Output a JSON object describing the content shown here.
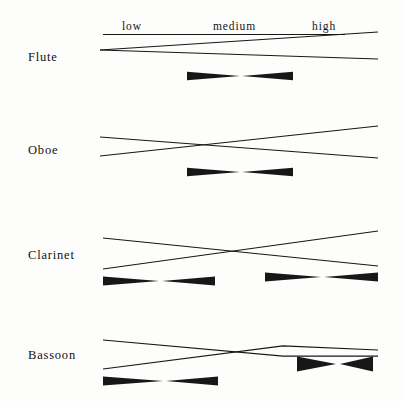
{
  "figure": {
    "background_color": "#fdfdfc",
    "ink_color": "#171717",
    "width": 403,
    "height": 401
  },
  "register_headers": [
    {
      "label": "low",
      "x": 122,
      "y": 30
    },
    {
      "label": "medium",
      "x": 213,
      "y": 30
    },
    {
      "label": "high",
      "x": 312,
      "y": 30
    }
  ],
  "header_rule": {
    "x1": 103,
    "y1": 34,
    "x2": 345,
    "y2": 34
  },
  "instruments": [
    {
      "name": "Flute",
      "label_x": 28,
      "label_y": 61,
      "baseline": 50,
      "lines": [
        {
          "name": "upper-envelope",
          "points": "100,50 378,32"
        },
        {
          "name": "lower-envelope",
          "points": "100,50 378,59"
        }
      ],
      "markers": [
        {
          "name": "bowtie-medium",
          "x_left": 187,
          "x_right": 293,
          "x_center": 240,
          "y": 76,
          "half_height": 4.2
        }
      ]
    },
    {
      "name": "Oboe",
      "label_x": 28,
      "label_y": 154,
      "baseline": 147,
      "lines": [
        {
          "name": "upper-envelope",
          "points": "100,137 378,158"
        },
        {
          "name": "lower-envelope",
          "points": "100,156 378,126"
        }
      ],
      "markers": [
        {
          "name": "bowtie-medium",
          "x_left": 187,
          "x_right": 293,
          "x_center": 240,
          "y": 172,
          "half_height": 4.2
        }
      ]
    },
    {
      "name": "Clarinet",
      "label_x": 28,
      "label_y": 259,
      "baseline": 252,
      "lines": [
        {
          "name": "upper-envelope",
          "points": "103,238 378,266"
        },
        {
          "name": "lower-envelope",
          "points": "103,269 378,231"
        }
      ],
      "markers": [
        {
          "name": "bowtie-low",
          "x_left": 103,
          "x_right": 215,
          "x_center": 159,
          "y": 281,
          "half_height": 4.6
        },
        {
          "name": "bowtie-high",
          "x_left": 265,
          "x_right": 378,
          "x_center": 321,
          "y": 277,
          "half_height": 4.6
        }
      ]
    },
    {
      "name": "Bassoon",
      "label_x": 28,
      "label_y": 359,
      "baseline": 352,
      "lines": [
        {
          "name": "upper-envelope",
          "points": "103,340 283,356 378,356"
        },
        {
          "name": "lower-envelope",
          "points": "103,369 283,346 378,350"
        }
      ],
      "markers": [
        {
          "name": "bowtie-low",
          "x_left": 103,
          "x_right": 218,
          "x_center": 163,
          "y": 381,
          "half_height": 4.6
        },
        {
          "name": "bowtie-high",
          "x_left": 297,
          "x_right": 373,
          "x_center": 336,
          "y": 364,
          "half_height": 7.5
        }
      ]
    }
  ]
}
